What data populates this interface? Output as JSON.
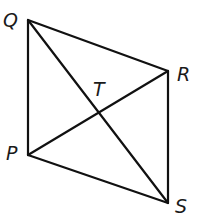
{
  "diagram": {
    "type": "quadrilateral-with-diagonals",
    "vertices": [
      {
        "id": "Q",
        "label": "Q",
        "x": 28,
        "y": 20,
        "label_x": 3,
        "label_y": 27
      },
      {
        "id": "R",
        "label": "R",
        "x": 168,
        "y": 71,
        "label_x": 177,
        "label_y": 81
      },
      {
        "id": "S",
        "label": "S",
        "x": 168,
        "y": 203,
        "label_x": 175,
        "label_y": 213
      },
      {
        "id": "P",
        "label": "P",
        "x": 28,
        "y": 155,
        "label_x": 6,
        "label_y": 160
      },
      {
        "id": "T",
        "label": "T",
        "x": 97,
        "y": 111,
        "label_x": 93,
        "label_y": 96
      }
    ],
    "sides": [
      {
        "from": "Q",
        "to": "R"
      },
      {
        "from": "R",
        "to": "S"
      },
      {
        "from": "S",
        "to": "P"
      },
      {
        "from": "P",
        "to": "Q"
      }
    ],
    "diagonals": [
      {
        "from": "Q",
        "to": "S"
      },
      {
        "from": "P",
        "to": "R"
      }
    ],
    "intersection": "T",
    "colors": {
      "line": "#111111",
      "label": "#1a1a1a",
      "background": "#ffffff"
    }
  }
}
